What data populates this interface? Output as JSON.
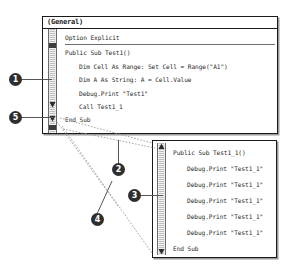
{
  "windows": {
    "general": {
      "title": "(General)",
      "lines": [
        "Option Explicit",
        "Public Sub Test1()",
        "Dim Cell As Range: Set Cell = Range(\"A1\")",
        "Dim A As String: A = Cell.Value",
        "Debug.Print \"Test1\"",
        "Call Test1_1",
        "End Sub"
      ]
    },
    "sub": {
      "lines": [
        "Public Sub Test1_1()",
        "Debug.Print \"Test1_1\"",
        "Debug.Print \"Test1_1\"",
        "Debug.Print \"Test1_1\"",
        "Debug.Print \"Test1_1\"",
        "Debug.Print \"Test1_1\"",
        "End Sub"
      ]
    }
  },
  "callouts": [
    {
      "id": "1",
      "label": "1"
    },
    {
      "id": "2",
      "label": "2"
    },
    {
      "id": "3",
      "label": "3"
    },
    {
      "id": "4",
      "label": "4"
    },
    {
      "id": "5",
      "label": "5"
    }
  ],
  "colors": {
    "marker_fill": "#2e2e2e",
    "marker_text": "#ffffff",
    "window_border": "#1a1a1a",
    "code_text": "#2b2b2b",
    "scroll_thumb": "#3d3d3d",
    "leader_line": "#555555"
  }
}
